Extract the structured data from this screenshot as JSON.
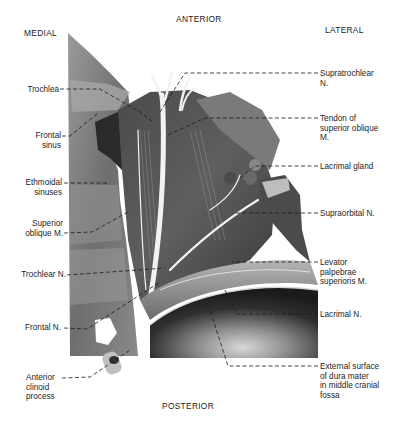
{
  "figure": {
    "type": "anatomical-dissection",
    "orientation": {
      "anterior": "ANTERIOR",
      "posterior": "POSTERIOR",
      "medial": "MEDIAL",
      "lateral": "LATERAL"
    },
    "labels_left": [
      {
        "id": "trochlea",
        "text": "Trochlea"
      },
      {
        "id": "frontal-sinus",
        "text": "Frontal\nsinus"
      },
      {
        "id": "ethmoidal-sinuses",
        "text": "Ethmoidal\nsinuses"
      },
      {
        "id": "superior-oblique",
        "text": "Superior\noblique M."
      },
      {
        "id": "trochlear-n",
        "text": "Trochlear N."
      },
      {
        "id": "frontal-n",
        "text": "Frontal N."
      },
      {
        "id": "anterior-clinoid",
        "text": "Anterior\nclinoid\nprocess"
      }
    ],
    "labels_right": [
      {
        "id": "supratrochlear-n",
        "text": "Supratrochlear\nN."
      },
      {
        "id": "tendon-superior-oblique",
        "text": "Tendon of\nsuperior oblique\nM."
      },
      {
        "id": "lacrimal-gland",
        "text": "Lacrimal gland"
      },
      {
        "id": "supraorbital-n",
        "text": "Supraorbital N."
      },
      {
        "id": "levator",
        "text": "Levator\npalpebrae\nsuperioris M."
      },
      {
        "id": "lacrimal-n",
        "text": "Lacrimal N."
      },
      {
        "id": "dura",
        "text": "External surface\nof dura mater\nin middle cranial\nfossa"
      }
    ]
  }
}
